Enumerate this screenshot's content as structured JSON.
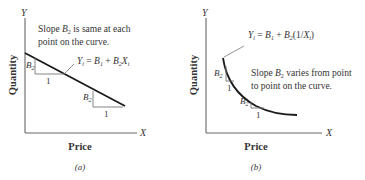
{
  "panels": [
    {
      "id": "a",
      "caption": "(a)",
      "y_axis_label": "Y",
      "x_axis_label": "X",
      "y_title": "Quantity",
      "x_title": "Price",
      "note_line1_pre": "Slope ",
      "note_line1_var": "B",
      "note_line1_sub": "2",
      "note_line1_post": " is same at each",
      "note_line2": "point on the curve.",
      "equation": {
        "lhs": "Y",
        "lhs_sub": "i",
        "eq": " = ",
        "b1": "B",
        "b1_sub": "1",
        "plus": " + ",
        "b2": "B",
        "b2_sub": "2",
        "x": "X",
        "x_sub": "i",
        "tail": ""
      },
      "triangles": [
        {
          "rise_label": "B",
          "rise_sub": "2",
          "run_label": "1"
        },
        {
          "rise_label": "B",
          "rise_sub": "2",
          "run_label": "1"
        }
      ],
      "curve_type": "linear"
    },
    {
      "id": "b",
      "caption": "(b)",
      "y_axis_label": "Y",
      "x_axis_label": "X",
      "y_title": "Quantity",
      "x_title": "Price",
      "note_line1_pre": "Slope ",
      "note_line1_var": "B",
      "note_line1_sub": "2",
      "note_line1_post": " varies from point",
      "note_line2": "to point on the curve.",
      "equation": {
        "lhs": "Y",
        "lhs_sub": "i",
        "eq": " = ",
        "b1": "B",
        "b1_sub": "1",
        "plus": " + ",
        "b2": "B",
        "b2_sub": "2",
        "x_pre": "(1/",
        "x": "X",
        "x_sub": "i",
        "tail": ")"
      },
      "triangles": [
        {
          "rise_label": "B",
          "rise_sub": "2",
          "run_label": "1"
        },
        {
          "rise_label": "B",
          "rise_sub": "2",
          "run_label": "1"
        }
      ],
      "curve_type": "reciprocal"
    }
  ],
  "colors": {
    "axis": "#555555",
    "curve": "#1a1a1a",
    "triangle": "#777777",
    "text": "#333333"
  }
}
